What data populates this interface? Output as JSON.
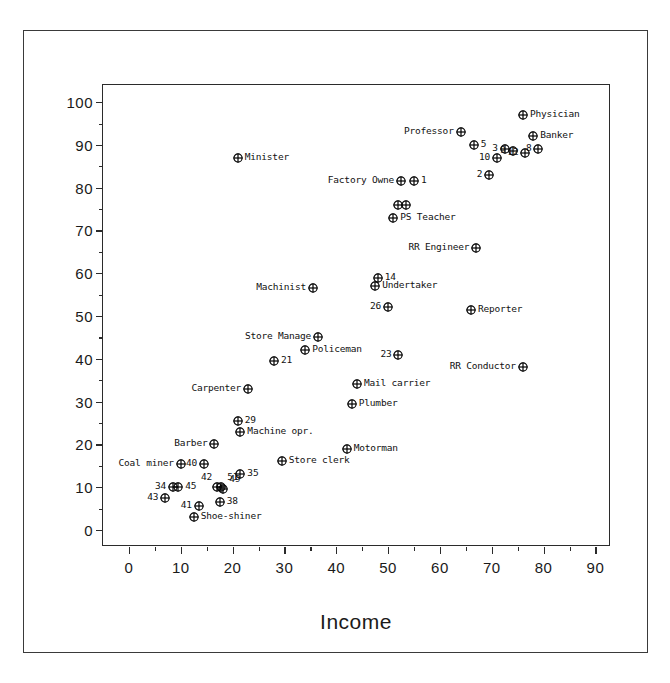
{
  "chart_data": {
    "type": "scatter",
    "title": "",
    "xlabel": "Income",
    "ylabel": "Prestige",
    "xlim": [
      -5,
      93
    ],
    "ylim": [
      -4,
      104
    ],
    "grid": false,
    "legend": "none",
    "xticks": [
      0,
      10,
      20,
      30,
      40,
      50,
      60,
      70,
      80,
      90
    ],
    "xticks_minor": [
      5,
      15,
      25,
      35,
      45,
      55,
      65,
      75,
      85
    ],
    "yticks": [
      0,
      10,
      20,
      30,
      40,
      50,
      60,
      70,
      80,
      90,
      100
    ],
    "yticks_minor": [
      5,
      15,
      25,
      35,
      45,
      55,
      65,
      75,
      85,
      95
    ],
    "marker_style": "circle-plus",
    "points": [
      {
        "label": "Physician",
        "x": 76.0,
        "y": 97.0,
        "pos": "right"
      },
      {
        "label": "Professor",
        "x": 64.0,
        "y": 93.0,
        "pos": "left"
      },
      {
        "label": "Banker",
        "x": 78.0,
        "y": 92.0,
        "pos": "right"
      },
      {
        "label": "5",
        "x": 66.5,
        "y": 90.0,
        "pos": "right"
      },
      {
        "label": "3",
        "x": 72.5,
        "y": 89.0,
        "pos": "left"
      },
      {
        "label": "9",
        "x": 74.0,
        "y": 88.5,
        "pos": "left"
      },
      {
        "label": "8",
        "x": 79.0,
        "y": 89.0,
        "pos": "left"
      },
      {
        "label": "12",
        "x": 76.5,
        "y": 88.0,
        "pos": "left"
      },
      {
        "label": "10",
        "x": 71.0,
        "y": 87.0,
        "pos": "left"
      },
      {
        "label": "Minister",
        "x": 21.0,
        "y": 87.0,
        "pos": "right"
      },
      {
        "label": "2",
        "x": 69.5,
        "y": 83.0,
        "pos": "left"
      },
      {
        "label": "Factory Owne",
        "x": 52.5,
        "y": 81.5,
        "pos": "left"
      },
      {
        "label": "1",
        "x": 55.0,
        "y": 81.5,
        "pos": "right"
      },
      {
        "label": "",
        "x": 52.0,
        "y": 76.0,
        "pos": "none"
      },
      {
        "label": "",
        "x": 53.5,
        "y": 76.0,
        "pos": "none"
      },
      {
        "label": "PS Teacher",
        "x": 51.0,
        "y": 73.0,
        "pos": "right"
      },
      {
        "label": "RR Engineer",
        "x": 67.0,
        "y": 66.0,
        "pos": "left"
      },
      {
        "label": "14",
        "x": 48.0,
        "y": 59.0,
        "pos": "right"
      },
      {
        "label": "Undertaker",
        "x": 47.5,
        "y": 57.0,
        "pos": "right"
      },
      {
        "label": "Machinist",
        "x": 35.5,
        "y": 56.5,
        "pos": "left"
      },
      {
        "label": "26",
        "x": 50.0,
        "y": 52.0,
        "pos": "left"
      },
      {
        "label": "Reporter",
        "x": 66.0,
        "y": 51.5,
        "pos": "right"
      },
      {
        "label": "Store Manage",
        "x": 36.5,
        "y": 45.0,
        "pos": "left"
      },
      {
        "label": "Policeman",
        "x": 34.0,
        "y": 42.0,
        "pos": "right"
      },
      {
        "label": "23",
        "x": 52.0,
        "y": 41.0,
        "pos": "left"
      },
      {
        "label": "21",
        "x": 28.0,
        "y": 39.5,
        "pos": "right"
      },
      {
        "label": "RR Conductor",
        "x": 76.0,
        "y": 38.0,
        "pos": "left"
      },
      {
        "label": "Mail carrier",
        "x": 44.0,
        "y": 34.0,
        "pos": "right"
      },
      {
        "label": "Plumber",
        "x": 43.0,
        "y": 29.5,
        "pos": "right"
      },
      {
        "label": "Carpenter",
        "x": 23.0,
        "y": 33.0,
        "pos": "left"
      },
      {
        "label": "29",
        "x": 21.0,
        "y": 25.5,
        "pos": "right"
      },
      {
        "label": "Machine opr.",
        "x": 21.5,
        "y": 23.0,
        "pos": "right"
      },
      {
        "label": "Barber",
        "x": 16.5,
        "y": 20.0,
        "pos": "left"
      },
      {
        "label": "Motorman",
        "x": 42.0,
        "y": 19.0,
        "pos": "right"
      },
      {
        "label": "Coal miner",
        "x": 10.0,
        "y": 15.5,
        "pos": "left"
      },
      {
        "label": "Store clerk",
        "x": 29.5,
        "y": 16.0,
        "pos": "right"
      },
      {
        "label": "40",
        "x": 14.5,
        "y": 15.5,
        "pos": "left"
      },
      {
        "label": "35",
        "x": 21.5,
        "y": 13.0,
        "pos": "right"
      },
      {
        "label": "34",
        "x": 8.5,
        "y": 10.0,
        "pos": "left"
      },
      {
        "label": "45",
        "x": 9.5,
        "y": 10.0,
        "pos": "right"
      },
      {
        "label": "42",
        "x": 17.0,
        "y": 10.0,
        "pos": "aboveleft"
      },
      {
        "label": "51",
        "x": 17.8,
        "y": 10.0,
        "pos": "above"
      },
      {
        "label": "49",
        "x": 18.2,
        "y": 9.5,
        "pos": "above"
      },
      {
        "label": "43",
        "x": 7.0,
        "y": 7.5,
        "pos": "left"
      },
      {
        "label": "38",
        "x": 17.5,
        "y": 6.5,
        "pos": "right"
      },
      {
        "label": "41",
        "x": 13.5,
        "y": 5.5,
        "pos": "left"
      },
      {
        "label": "Shoe-shiner",
        "x": 12.5,
        "y": 3.0,
        "pos": "right"
      }
    ]
  }
}
